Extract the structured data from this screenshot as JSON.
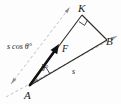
{
  "figure": {
    "type": "geometry-vector-diagram",
    "background_color": "#fdfdfd",
    "ink_color": "#2b2b2b",
    "guide_color": "#b9b9b9",
    "vector_color": "#111111"
  },
  "vertices": [
    {
      "id": "A",
      "label": "A",
      "x": 29,
      "y": 86,
      "role": "origin-of-force-vector"
    },
    {
      "id": "K",
      "label": "K",
      "x": 82,
      "y": 13,
      "role": "right-angle-vertex"
    },
    {
      "id": "B",
      "label": "B",
      "x": 109,
      "y": 41,
      "role": "endpoint-of-displacement"
    }
  ],
  "vectors": [
    {
      "id": "F",
      "label": "F",
      "from": "A",
      "to": "toward-K",
      "style": "bold-arrow",
      "label_x": 62,
      "label_y": 50
    }
  ],
  "angles": [
    {
      "id": "theta-at-A",
      "label": "θ°",
      "at_vertex": "A",
      "between": [
        "F",
        "AB"
      ],
      "label_x": 44,
      "label_y": 70
    },
    {
      "id": "right-angle-at-K",
      "label": "",
      "at_vertex": "K",
      "marker": "square",
      "value": "90"
    }
  ],
  "measurements": [
    {
      "id": "s-cos-theta",
      "label": "s cos θ°",
      "along": "direction-AK",
      "label_x": 8,
      "label_y": 48
    },
    {
      "id": "s",
      "label": "s",
      "along": "direction-AB",
      "label_x": 73,
      "label_y": 72
    }
  ],
  "edges": [
    {
      "id": "A-K",
      "from": "A",
      "to": "K",
      "style": "solid"
    },
    {
      "id": "K-B",
      "from": "K",
      "to": "B",
      "style": "solid"
    },
    {
      "id": "A-B",
      "from": "A",
      "to": "B",
      "style": "solid"
    }
  ],
  "guides": [
    {
      "id": "guide-parallel-AK",
      "style": "dashed",
      "arrows": "both-ends",
      "parallel_to": "A-K"
    },
    {
      "id": "guide-parallel-AB",
      "style": "dashed",
      "arrows": "both-ends",
      "parallel_to": "A-B"
    }
  ]
}
